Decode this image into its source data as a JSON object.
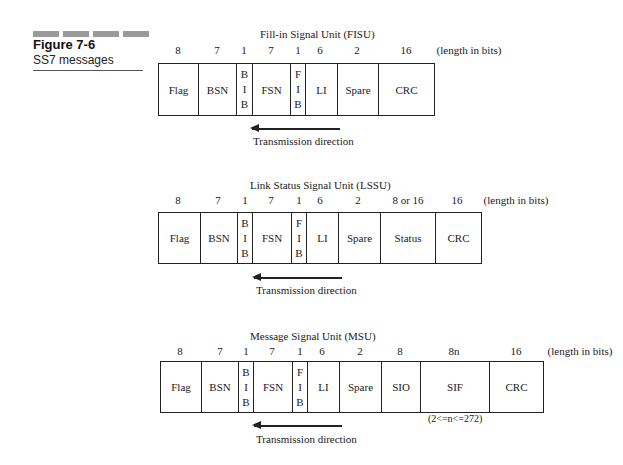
{
  "figure": {
    "number": "Figure 7-6",
    "caption": "SS7 messages"
  },
  "units_label": "(length in bits)",
  "direction_label": "Transmission direction",
  "units": [
    {
      "title": "Fill-in Signal Unit (FISU)",
      "fields": [
        {
          "name": "Flag",
          "bits": "8"
        },
        {
          "name": "BSN",
          "bits": "7"
        },
        {
          "name": "BIB",
          "bits": "1",
          "stacked": [
            "B",
            "I",
            "B"
          ]
        },
        {
          "name": "FSN",
          "bits": "7"
        },
        {
          "name": "FIB",
          "bits": "1",
          "stacked": [
            "F",
            "I",
            "B"
          ]
        },
        {
          "name": "LI",
          "bits": "6"
        },
        {
          "name": "Spare",
          "bits": "2"
        },
        {
          "name": "CRC",
          "bits": "16"
        }
      ]
    },
    {
      "title": "Link Status Signal Unit (LSSU)",
      "fields": [
        {
          "name": "Flag",
          "bits": "8"
        },
        {
          "name": "BSN",
          "bits": "7"
        },
        {
          "name": "BIB",
          "bits": "1",
          "stacked": [
            "B",
            "I",
            "B"
          ]
        },
        {
          "name": "FSN",
          "bits": "7"
        },
        {
          "name": "FIB",
          "bits": "1",
          "stacked": [
            "F",
            "I",
            "B"
          ]
        },
        {
          "name": "LI",
          "bits": "6"
        },
        {
          "name": "Spare",
          "bits": "2"
        },
        {
          "name": "Status",
          "bits": "8 or 16"
        },
        {
          "name": "CRC",
          "bits": "16"
        }
      ]
    },
    {
      "title": "Message Signal Unit (MSU)",
      "fields": [
        {
          "name": "Flag",
          "bits": "8"
        },
        {
          "name": "BSN",
          "bits": "7"
        },
        {
          "name": "BIB",
          "bits": "1",
          "stacked": [
            "B",
            "I",
            "B"
          ]
        },
        {
          "name": "FSN",
          "bits": "7"
        },
        {
          "name": "FIB",
          "bits": "1",
          "stacked": [
            "F",
            "I",
            "B"
          ]
        },
        {
          "name": "LI",
          "bits": "6"
        },
        {
          "name": "Spare",
          "bits": "2"
        },
        {
          "name": "SIO",
          "bits": "8"
        },
        {
          "name": "SIF",
          "bits": "8n"
        },
        {
          "name": "CRC",
          "bits": "16"
        }
      ],
      "note": "(2<=n<=272)"
    }
  ]
}
